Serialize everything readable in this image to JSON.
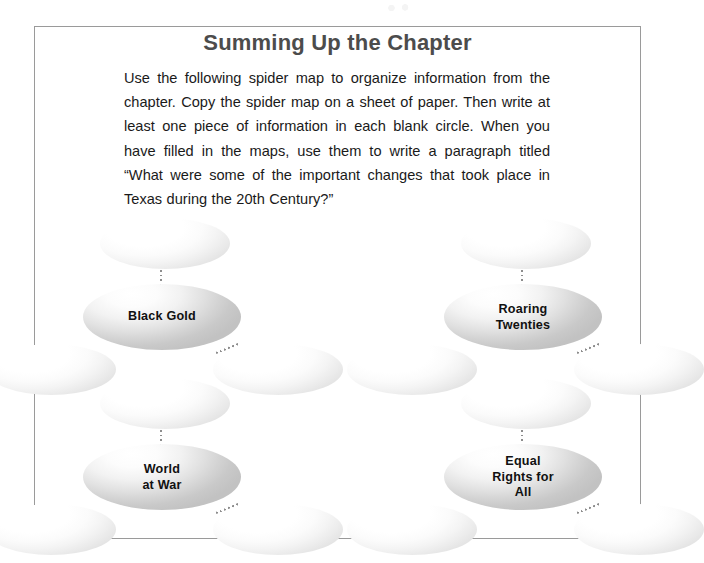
{
  "page": {
    "heading": "Summing Up the Chapter",
    "intro_paragraph": "Use the following spider map to organize information from the chapter. Copy the spider map on a sheet of paper. Then write at least one piece of information in each blank circle. When you have filled in the maps, use them to write a paragraph titled “What were some of the important changes that took place in Texas during the 20th Century?”",
    "border_color": "#9a9a9a",
    "heading_color": "#4c4c4c",
    "body_text_color": "#1a1a1a"
  },
  "spider_map": {
    "connector_color": "#8d8d8d",
    "clusters": [
      {
        "id": "black-gold",
        "topic_label": "Black Gold",
        "blank_circles": 3
      },
      {
        "id": "roaring-twenties",
        "topic_label": "Roaring\nTwenties",
        "blank_circles": 3
      },
      {
        "id": "world-at-war",
        "topic_label": "World\nat War",
        "blank_circles": 3
      },
      {
        "id": "equal-rights-for-all",
        "topic_label": "Equal\nRights for\nAll",
        "blank_circles": 3
      }
    ]
  }
}
